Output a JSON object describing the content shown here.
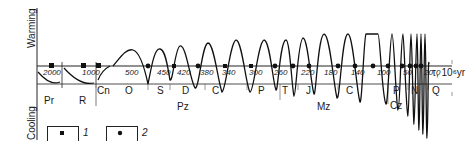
{
  "axis": {
    "y_top_label": "Warming",
    "y_bottom_label": "Cooling",
    "x_label": "τ, 10⁶yr"
  },
  "ticks": [
    {
      "label": "2000",
      "x": 49
    },
    {
      "label": "1000",
      "x": 88
    },
    {
      "label": "500",
      "x": 131
    },
    {
      "label": "450",
      "x": 163
    },
    {
      "label": "420",
      "x": 183
    },
    {
      "label": "380",
      "x": 206
    },
    {
      "label": "340",
      "x": 228
    },
    {
      "label": "300",
      "x": 255
    },
    {
      "label": "260",
      "x": 280
    },
    {
      "label": "220",
      "x": 307
    },
    {
      "label": "180",
      "x": 330
    },
    {
      "label": "140",
      "x": 357
    },
    {
      "label": "100",
      "x": 383
    },
    {
      "label": "50",
      "x": 409
    },
    {
      "label": "20",
      "x": 430
    },
    {
      "label": "0",
      "x": 442
    }
  ],
  "periods": [
    {
      "label": "Pr",
      "x": 44,
      "y": 96
    },
    {
      "label": "R",
      "x": 79,
      "y": 96
    },
    {
      "label": "Cn",
      "x": 97,
      "y": 86
    },
    {
      "label": "O",
      "x": 125,
      "y": 86
    },
    {
      "label": "S",
      "x": 157,
      "y": 86
    },
    {
      "label": "D",
      "x": 182,
      "y": 86
    },
    {
      "label": "C",
      "x": 212,
      "y": 86
    },
    {
      "label": "P",
      "x": 258,
      "y": 86
    },
    {
      "label": "T",
      "x": 282,
      "y": 86
    },
    {
      "label": "J",
      "x": 306,
      "y": 86
    },
    {
      "label": "C",
      "x": 346,
      "y": 86
    },
    {
      "label": "P",
      "x": 393,
      "y": 86
    },
    {
      "label": "N",
      "x": 411,
      "y": 86
    },
    {
      "label": "Q",
      "x": 432,
      "y": 86
    }
  ],
  "eras": [
    {
      "label": "Pz",
      "x": 177,
      "y": 102
    },
    {
      "label": "Mz",
      "x": 317,
      "y": 102
    },
    {
      "label": "Cz",
      "x": 390,
      "y": 101
    }
  ],
  "legend": [
    {
      "num": "1",
      "marker": "square",
      "x": 48
    },
    {
      "num": "2",
      "marker": "circle",
      "x": 105
    }
  ]
}
